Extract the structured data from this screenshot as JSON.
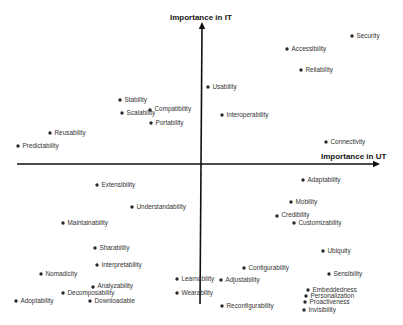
{
  "diagram": {
    "y_axis": {
      "title": "Importance in IT",
      "title_pos": [
        170,
        20
      ],
      "from": [
        200,
        304
      ],
      "to": [
        202,
        22
      ]
    },
    "x_axis": {
      "title": "Importance in UT",
      "title_pos": [
        321,
        159
      ],
      "from": [
        17,
        164
      ],
      "to": [
        380,
        164
      ]
    },
    "colors": {
      "axis": "#111111",
      "dot": "#2a2a2a",
      "label": "#333333"
    },
    "points": [
      {
        "label": "Security",
        "x": 352,
        "y": 36
      },
      {
        "label": "Accessibility",
        "x": 287,
        "y": 49
      },
      {
        "label": "Reliability",
        "x": 301,
        "y": 70
      },
      {
        "label": "Usability",
        "x": 208,
        "y": 87
      },
      {
        "label": "Interoperability",
        "x": 222,
        "y": 115
      },
      {
        "label": "Stability",
        "x": 120,
        "y": 100
      },
      {
        "label": "Scalability",
        "x": 122,
        "y": 113
      },
      {
        "label": "Compatibility",
        "x": 150,
        "y": 110,
        "dy": -1
      },
      {
        "label": "Portability",
        "x": 151,
        "y": 123
      },
      {
        "label": "Reusability",
        "x": 50,
        "y": 133
      },
      {
        "label": "Predictability",
        "x": 18,
        "y": 146
      },
      {
        "label": "Connectivity",
        "x": 326,
        "y": 142
      },
      {
        "label": "Extensibility",
        "x": 97,
        "y": 185
      },
      {
        "label": "Understandability",
        "x": 132,
        "y": 207
      },
      {
        "label": "Maintainability",
        "x": 63,
        "y": 223
      },
      {
        "label": "Adaptability",
        "x": 303,
        "y": 180
      },
      {
        "label": "Mobility",
        "x": 291,
        "y": 202
      },
      {
        "label": "Credibility",
        "x": 277,
        "y": 216,
        "dy": -1
      },
      {
        "label": "Customizability",
        "x": 294,
        "y": 223
      },
      {
        "label": "Sharability",
        "x": 95,
        "y": 248
      },
      {
        "label": "Interpretability",
        "x": 97,
        "y": 265
      },
      {
        "label": "Nomadicity",
        "x": 41,
        "y": 274
      },
      {
        "label": "Analyzability",
        "x": 93,
        "y": 287,
        "dy": -1
      },
      {
        "label": "Decomposability",
        "x": 63,
        "y": 293
      },
      {
        "label": "Adoptability",
        "x": 16,
        "y": 301
      },
      {
        "label": "Downloadable",
        "x": 90,
        "y": 301
      },
      {
        "label": "Ubiquity",
        "x": 323,
        "y": 251
      },
      {
        "label": "Configurability",
        "x": 244,
        "y": 268
      },
      {
        "label": "Sensibility",
        "x": 329,
        "y": 274
      },
      {
        "label": "Learnability",
        "x": 177,
        "y": 279
      },
      {
        "label": "Adjustability",
        "x": 221,
        "y": 280
      },
      {
        "label": "Wearability",
        "x": 177,
        "y": 293
      },
      {
        "label": "Reconfigurability",
        "x": 222,
        "y": 306
      },
      {
        "label": "Embeddedness",
        "x": 308,
        "y": 290
      },
      {
        "label": "Personalization",
        "x": 306,
        "y": 296
      },
      {
        "label": "Proactiveness",
        "x": 305,
        "y": 302
      },
      {
        "label": "Invisibility",
        "x": 304,
        "y": 310
      }
    ]
  }
}
